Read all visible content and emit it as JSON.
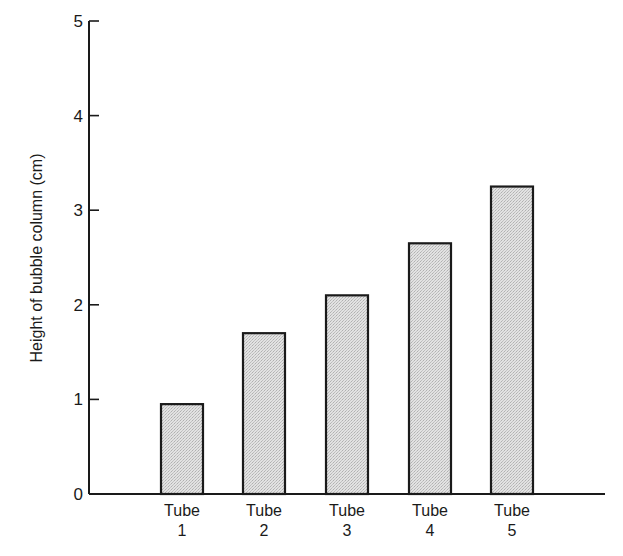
{
  "chart_data": {
    "type": "bar",
    "title": "",
    "xlabel": "",
    "ylabel": "Height of bubble column (cm)",
    "categories": [
      "Tube 1",
      "Tube 2",
      "Tube 3",
      "Tube 4",
      "Tube 5"
    ],
    "category_lines": [
      [
        "Tube",
        "1"
      ],
      [
        "Tube",
        "2"
      ],
      [
        "Tube",
        "3"
      ],
      [
        "Tube",
        "4"
      ],
      [
        "Tube",
        "5"
      ]
    ],
    "values": [
      0.95,
      1.7,
      2.1,
      2.65,
      3.25
    ],
    "ylim": [
      0,
      5
    ],
    "yticks": [
      0,
      1,
      2,
      3,
      4,
      5
    ],
    "grid": false,
    "legend": null,
    "bar_fill": "#d8d8d8",
    "bar_stroke": "#1a1a1a"
  }
}
